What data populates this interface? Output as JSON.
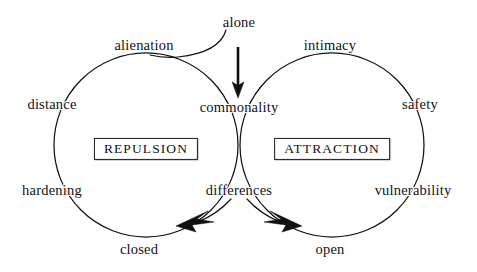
{
  "diagram": {
    "background_color": "#ffffff",
    "stroke_color": "#111111",
    "text_color": "#131313",
    "circles": [
      {
        "name": "repulsion-circle",
        "cx": 146,
        "cy": 145,
        "r": 92
      },
      {
        "name": "attraction-circle",
        "cx": 332,
        "cy": 145,
        "r": 92
      }
    ],
    "center_labels": [
      {
        "id": "repulsion",
        "text": "REPULSION",
        "x": 146,
        "y": 149
      },
      {
        "id": "attraction",
        "text": "ATTRACTION",
        "x": 332,
        "y": 149
      }
    ],
    "labels": [
      {
        "id": "alone",
        "text": "alone",
        "x": 239,
        "y": 22
      },
      {
        "id": "alienation",
        "text": "alienation",
        "x": 144,
        "y": 45
      },
      {
        "id": "intimacy",
        "text": "intimacy",
        "x": 330,
        "y": 45
      },
      {
        "id": "distance",
        "text": "distance",
        "x": 52,
        "y": 104
      },
      {
        "id": "commonality",
        "text": "commonality",
        "x": 239,
        "y": 107
      },
      {
        "id": "safety",
        "text": "safety",
        "x": 420,
        "y": 104
      },
      {
        "id": "hardening",
        "text": "hardening",
        "x": 52,
        "y": 190
      },
      {
        "id": "differences",
        "text": "differences",
        "x": 239,
        "y": 190
      },
      {
        "id": "vulnerability",
        "text": "vulnerability",
        "x": 413,
        "y": 190
      },
      {
        "id": "closed",
        "text": "closed",
        "x": 139,
        "y": 249
      },
      {
        "id": "open",
        "text": "open",
        "x": 330,
        "y": 249
      }
    ],
    "arrows": [
      {
        "id": "alone-to-commonality",
        "from": "alone",
        "to": "commonality",
        "direction": "down"
      },
      {
        "id": "differences-to-closed",
        "from": "differences",
        "to": "closed",
        "direction": "down-left"
      },
      {
        "id": "differences-to-open",
        "from": "differences",
        "to": "open",
        "direction": "down-right"
      }
    ],
    "connectors": [
      {
        "id": "alone-curve-left",
        "from": "alone",
        "to": "repulsion-circle-top"
      }
    ]
  }
}
